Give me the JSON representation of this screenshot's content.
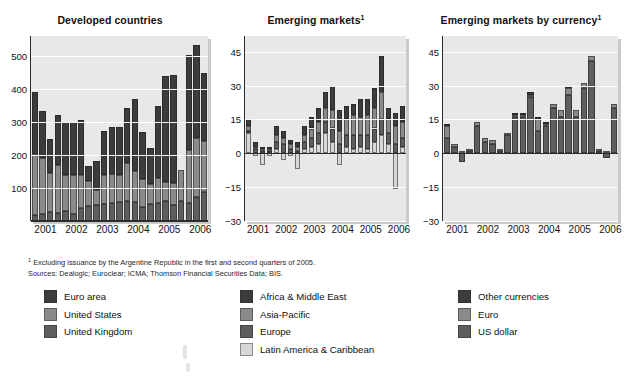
{
  "figure": {
    "background": "#ffffff",
    "plot_background": "#e7e8ea",
    "footnote_marker": "1",
    "footnote": "Excluding issuance by the Argentine Republic in the first and second quarters of 2005.",
    "sources": "Sources: Dealogic; Euroclear; ICMA; Thomson  Financial Securities Data; BIS."
  },
  "colors": {
    "dark": "#3c3c3c",
    "medium": "#5e5e5e",
    "light": "#8a8a8a",
    "pale": "#d6d7d9",
    "axis": "#2b2b2b",
    "grid": "#ffffff"
  },
  "chart_data": [
    {
      "type": "bar",
      "title": "Developed countries",
      "title_sup": "",
      "stacked": true,
      "xlabel": "",
      "ylabel": "",
      "ylim": [
        0,
        560
      ],
      "yticks": [
        100,
        200,
        300,
        400,
        500
      ],
      "grid": true,
      "legend_position": "below",
      "categories": [
        "2001 Q1",
        "2001 Q2",
        "2001 Q3",
        "2001 Q4",
        "2002 Q1",
        "2002 Q2",
        "2002 Q3",
        "2002 Q4",
        "2003 Q1",
        "2003 Q2",
        "2003 Q3",
        "2003 Q4",
        "2004 Q1",
        "2004 Q2",
        "2004 Q3",
        "2004 Q4",
        "2005 Q1",
        "2005 Q2",
        "2005 Q3",
        "2005 Q4",
        "2006 Q1",
        "2006 Q2",
        "2006 Q3"
      ],
      "tick_labels": [
        "2001",
        "2002",
        "2003",
        "2004",
        "2005",
        "2006"
      ],
      "series": [
        {
          "name": "United Kingdom",
          "color": "#5e5e5e",
          "values": [
            18,
            22,
            27,
            25,
            30,
            20,
            40,
            45,
            48,
            52,
            55,
            58,
            60,
            58,
            42,
            52,
            55,
            60,
            48,
            62,
            55,
            72,
            88
          ]
        },
        {
          "name": "United States",
          "color": "#8a8a8a",
          "values": [
            185,
            168,
            118,
            145,
            110,
            118,
            98,
            75,
            45,
            88,
            88,
            82,
            115,
            92,
            85,
            60,
            75,
            58,
            68,
            92,
            160,
            178,
            155
          ]
        },
        {
          "name": "Euro area",
          "color": "#3c3c3c",
          "values": [
            188,
            143,
            103,
            152,
            160,
            162,
            167,
            48,
            88,
            132,
            143,
            145,
            166,
            218,
            143,
            108,
            218,
            320,
            325,
            0,
            288,
            282,
            205
          ]
        }
      ],
      "totals": [
        391,
        333,
        248,
        322,
        300,
        300,
        305,
        168,
        181,
        272,
        286,
        285,
        341,
        368,
        270,
        220,
        348,
        438,
        441,
        154,
        503,
        532,
        448
      ]
    },
    {
      "type": "bar",
      "title": "Emerging markets",
      "title_sup": "1",
      "stacked": true,
      "xlabel": "",
      "ylabel": "",
      "ylim": [
        -30,
        52
      ],
      "yticks": [
        45,
        30,
        15,
        0,
        -15,
        -30
      ],
      "grid": true,
      "legend_position": "below",
      "categories": [
        "2001 Q1",
        "2001 Q2",
        "2001 Q3",
        "2001 Q4",
        "2002 Q1",
        "2002 Q2",
        "2002 Q3",
        "2002 Q4",
        "2003 Q1",
        "2003 Q2",
        "2003 Q3",
        "2003 Q4",
        "2004 Q1",
        "2004 Q2",
        "2004 Q3",
        "2004 Q4",
        "2005 Q1",
        "2005 Q2",
        "2005 Q3",
        "2005 Q4",
        "2006 Q1",
        "2006 Q2",
        "2006 Q3"
      ],
      "tick_labels": [
        "2001",
        "2002",
        "2003",
        "2004",
        "2005",
        "2006"
      ],
      "series": [
        {
          "name": "Latin America & Caribbean",
          "color": "#d6d7d9",
          "values": [
            9,
            -1,
            -5,
            -1,
            2,
            -3,
            -1,
            -7,
            2,
            3,
            4,
            9,
            5,
            -5,
            3,
            2,
            3,
            2,
            5,
            8,
            4,
            -16,
            3
          ]
        },
        {
          "name": "Europe",
          "color": "#5e5e5e",
          "values": [
            1,
            2,
            1,
            1,
            3,
            4,
            2,
            1,
            3,
            4,
            5,
            5,
            6,
            4,
            5,
            6,
            5,
            6,
            6,
            7,
            5,
            4,
            4
          ]
        },
        {
          "name": "Asia-Pacific",
          "color": "#8a8a8a",
          "values": [
            2,
            1,
            1,
            1,
            3,
            3,
            2,
            2,
            3,
            4,
            5,
            6,
            8,
            6,
            7,
            9,
            8,
            9,
            9,
            12,
            6,
            8,
            7
          ]
        },
        {
          "name": "Africa & Middle East",
          "color": "#3c3c3c",
          "values": [
            3,
            2,
            1,
            1,
            4,
            3,
            2,
            2,
            4,
            5,
            6,
            7,
            11,
            9,
            6,
            5,
            8,
            7,
            9,
            16,
            5,
            6,
            7
          ]
        }
      ],
      "totals": [
        15,
        4,
        -2,
        2,
        12,
        7,
        5,
        -2,
        12,
        16,
        20,
        27,
        30,
        14,
        21,
        22,
        24,
        24,
        29,
        43,
        20,
        2,
        21
      ]
    },
    {
      "type": "bar",
      "title": "Emerging markets by currency",
      "title_sup": "1",
      "stacked": true,
      "xlabel": "",
      "ylabel": "",
      "ylim": [
        -30,
        52
      ],
      "yticks": [
        45,
        30,
        15,
        0,
        -15,
        -30
      ],
      "grid": true,
      "legend_position": "below",
      "categories": [
        "2001 Q1",
        "2001 Q2",
        "2001 Q3",
        "2001 Q4",
        "2002 Q1",
        "2002 Q2",
        "2002 Q3",
        "2002 Q4",
        "2003 Q1",
        "2003 Q2",
        "2003 Q3",
        "2003 Q4",
        "2004 Q1",
        "2004 Q2",
        "2004 Q3",
        "2004 Q4",
        "2005 Q1",
        "2005 Q2",
        "2005 Q3",
        "2005 Q4",
        "2006 Q1",
        "2006 Q2",
        "2006 Q3"
      ],
      "tick_labels": [
        "2001",
        "2002",
        "2003",
        "2004",
        "2005",
        "2006"
      ],
      "series": [
        {
          "name": "US dollar",
          "color": "#5e5e5e",
          "values": [
            7,
            3,
            -4,
            1,
            12,
            5,
            4,
            1,
            8,
            16,
            16,
            25,
            10,
            12,
            20,
            16,
            26,
            16,
            29,
            41,
            1,
            -2,
            20
          ]
        },
        {
          "name": "Euro",
          "color": "#8a8a8a",
          "values": [
            5,
            1,
            1,
            1,
            2,
            2,
            2,
            1,
            1,
            1,
            1,
            1,
            5,
            1,
            2,
            3,
            3,
            3,
            2,
            2,
            1,
            1,
            2
          ]
        },
        {
          "name": "Other currencies",
          "color": "#3c3c3c",
          "values": [
            1,
            0,
            0,
            0,
            0,
            0,
            0,
            0,
            0,
            1,
            1,
            1,
            1,
            1,
            0,
            0,
            1,
            0,
            0,
            0,
            0,
            0,
            0
          ]
        }
      ],
      "totals": [
        13,
        4,
        -3,
        2,
        14,
        7,
        6,
        2,
        9,
        18,
        18,
        27,
        16,
        14,
        22,
        19,
        30,
        19,
        31,
        43,
        2,
        -3,
        22
      ]
    }
  ],
  "legend_columns": [
    {
      "name": "developed-countries-legend",
      "items": [
        {
          "label": "Euro area",
          "color": "#3c3c3c"
        },
        {
          "label": "United States",
          "color": "#8a8a8a"
        },
        {
          "label": "United Kingdom",
          "color": "#5e5e5e"
        }
      ]
    },
    {
      "name": "emerging-markets-legend",
      "items": [
        {
          "label": "Africa & Middle East",
          "color": "#3c3c3c"
        },
        {
          "label": "Asia-Pacific",
          "color": "#8a8a8a"
        },
        {
          "label": "Europe",
          "color": "#5e5e5e"
        },
        {
          "label": "Latin America & Caribbean",
          "color": "#d6d7d9"
        }
      ]
    },
    {
      "name": "currency-legend",
      "items": [
        {
          "label": "Other currencies",
          "color": "#3c3c3c"
        },
        {
          "label": "Euro",
          "color": "#8a8a8a"
        },
        {
          "label": "US dollar",
          "color": "#5e5e5e"
        }
      ]
    }
  ]
}
